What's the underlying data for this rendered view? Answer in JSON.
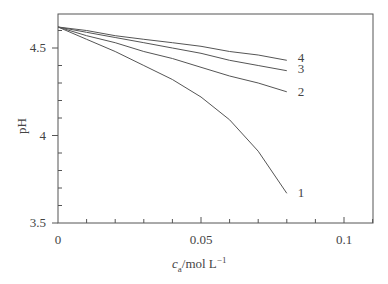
{
  "chart_data": {
    "type": "line",
    "title": "",
    "xlabel": "c_a/mol L^-1",
    "xlabel_parts": {
      "var": "c",
      "sub": "a",
      "unit": "/mol L",
      "sup": "−1"
    },
    "ylabel": "pH",
    "xlim": [
      0,
      0.11
    ],
    "ylim": [
      3.5,
      4.7
    ],
    "xticks": [
      0,
      0.05,
      0.1
    ],
    "xtick_labels": [
      "0",
      "0.05",
      "0.1"
    ],
    "yticks": [
      3.5,
      4,
      4.5
    ],
    "ytick_labels": [
      "3.5",
      "4",
      "4.5"
    ],
    "grid": false,
    "legend": "inline curve labels at right end",
    "x": [
      0,
      0.01,
      0.02,
      0.03,
      0.04,
      0.05,
      0.06,
      0.07,
      0.08
    ],
    "series": [
      {
        "name": "1",
        "values": [
          4.62,
          4.55,
          4.48,
          4.4,
          4.32,
          4.22,
          4.09,
          3.91,
          3.67
        ]
      },
      {
        "name": "2",
        "values": [
          4.62,
          4.57,
          4.53,
          4.48,
          4.44,
          4.39,
          4.34,
          4.3,
          4.25
        ]
      },
      {
        "name": "3",
        "values": [
          4.62,
          4.59,
          4.56,
          4.53,
          4.5,
          4.47,
          4.43,
          4.4,
          4.37
        ]
      },
      {
        "name": "4",
        "values": [
          4.62,
          4.6,
          4.57,
          4.55,
          4.53,
          4.51,
          4.48,
          4.46,
          4.43
        ]
      }
    ]
  }
}
